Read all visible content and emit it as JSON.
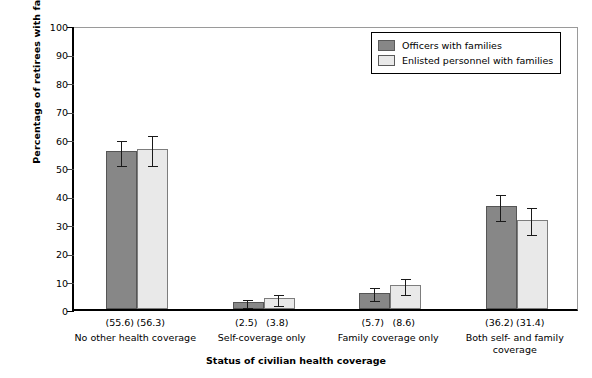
{
  "chart_data": {
    "type": "bar",
    "title": "",
    "xlabel": "Status of civilian health coverage",
    "ylabel": "Percentage of retirees with families",
    "ylim": [
      0,
      100
    ],
    "ytick_step": 10,
    "yticks": [
      "0",
      "10",
      "20",
      "30",
      "40",
      "50",
      "60",
      "70",
      "80",
      "90",
      "100"
    ],
    "grid": false,
    "legend_position": "top-right",
    "categories": [
      "No other health coverage",
      "Self-coverage only",
      "Family coverage only",
      "Both self- and family coverage"
    ],
    "series": [
      {
        "name": "Officers with families",
        "color": "#878787",
        "values": [
          55.6,
          2.5,
          5.7,
          36.2
        ],
        "value_labels": [
          "(55.6)",
          "(2.5)",
          "(5.7)",
          "(36.2)"
        ],
        "err_low": [
          51.3,
          1.0,
          3.6,
          31.6
        ],
        "err_high": [
          60.0,
          4.1,
          8.0,
          41.0
        ]
      },
      {
        "name": "Enlisted personnel with families",
        "color": "#e9e9e9",
        "values": [
          56.3,
          3.8,
          8.6,
          31.4
        ],
        "value_labels": [
          "(56.3)",
          "(3.8)",
          "(8.6)",
          "(31.4)"
        ],
        "err_low": [
          51.2,
          1.9,
          5.8,
          26.8
        ],
        "err_high": [
          61.6,
          5.8,
          11.5,
          36.3
        ]
      }
    ]
  },
  "legend": {
    "items": [
      {
        "label": "Officers with families",
        "swatch": "dark"
      },
      {
        "label": "Enlisted personnel with families",
        "swatch": "light"
      }
    ]
  },
  "axes": {
    "y_title": "Percentage of retirees with families",
    "x_title": "Status of civilian health coverage"
  }
}
